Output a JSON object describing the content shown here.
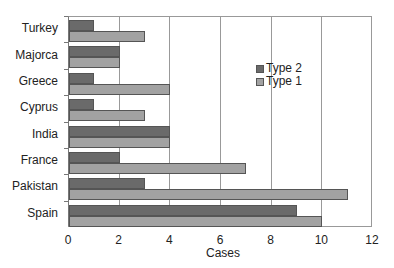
{
  "chart_data": {
    "type": "bar",
    "orientation": "horizontal",
    "title": "",
    "xlabel": "Cases",
    "ylabel": "",
    "xlim": [
      0,
      12
    ],
    "x_ticks": [
      "0",
      "2",
      "4",
      "6",
      "8",
      "10",
      "12"
    ],
    "grid": true,
    "legend_position": "inside-right",
    "categories": [
      "Turkey",
      "Majorca",
      "Greece",
      "Cyprus",
      "India",
      "France",
      "Pakistan",
      "Spain"
    ],
    "series": [
      {
        "name": "Type 2",
        "color": "#6a6a6a",
        "values": [
          1,
          2,
          1,
          1,
          4,
          2,
          3,
          9
        ]
      },
      {
        "name": "Type 1",
        "color": "#a2a2a2",
        "values": [
          3,
          2,
          4,
          3,
          4,
          7,
          11,
          10
        ]
      }
    ]
  },
  "legend": {
    "items": [
      "Type 2",
      "Type 1"
    ]
  }
}
